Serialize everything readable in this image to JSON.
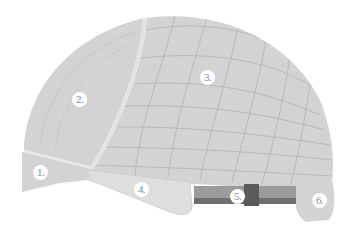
{
  "diagram": {
    "colors": {
      "background": "#ffffff",
      "cap_fill": "#d3d3d3",
      "panel_light": "#dedede",
      "grid_line": "#b9b9b9",
      "seam": "#e8e8e8",
      "strap": "#9b9b9b",
      "strap_dark": "#6f6f6f",
      "strap_buckle": "#5a5a5a",
      "label_bg": "#ffffff",
      "label_text": "#8a8a8a"
    },
    "labels": [
      {
        "id": 1,
        "text": "1.",
        "x": 40,
        "y": 172
      },
      {
        "id": 2,
        "text": "2.",
        "x": 79,
        "y": 99
      },
      {
        "id": 3,
        "text": "3.",
        "x": 207,
        "y": 77
      },
      {
        "id": 4,
        "text": "4.",
        "x": 141,
        "y": 189
      },
      {
        "id": 5,
        "text": "5.",
        "x": 237,
        "y": 196
      },
      {
        "id": 6,
        "text": "6.",
        "x": 319,
        "y": 200
      }
    ]
  }
}
